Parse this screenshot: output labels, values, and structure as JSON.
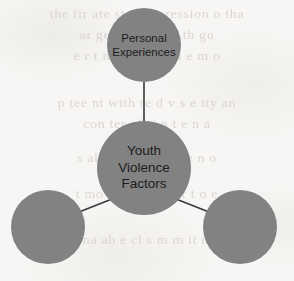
{
  "background": {
    "page_color": "#f7f6f4",
    "ghost_text_color": "#cfcbc6",
    "ghost_lines": [
      "the fir ate state s pression o  tha",
      "ar    ge      re ua     r ion  th  gu",
      "e r  t  n  e  re  ces   tin   e m   o",
      "p tee nt with  re d v s  e    ity   an",
      "con ter   of       ti n  t  e   n  a",
      "s al er  nt  ve     e  ss   re n  o",
      "t  mo  an  str    re   n  ar  t  o  e",
      "e  na ab e  cl s  m  m   it  n  ti"
    ]
  },
  "diagram": {
    "type": "hub-and-spoke",
    "node_color": "#828282",
    "connector_color": "#3a3a3a",
    "nodes": [
      {
        "id": "hub",
        "label": "Youth\nViolence\nFactors",
        "role": "center",
        "has_label": true,
        "diameter": 94,
        "center_x": 144,
        "center_y": 168
      },
      {
        "id": "personal-experiences",
        "label": "Personal\nExperiences",
        "role": "spoke",
        "has_label": true,
        "diameter": 74,
        "center_x": 144,
        "center_y": 45
      },
      {
        "id": "factor-2",
        "label": "",
        "role": "spoke",
        "has_label": false,
        "diameter": 74,
        "center_x": 48,
        "center_y": 227
      },
      {
        "id": "factor-3",
        "label": "",
        "role": "spoke",
        "has_label": false,
        "diameter": 74,
        "center_x": 240,
        "center_y": 227
      }
    ],
    "connectors": [
      {
        "from": "hub",
        "to": "personal-experiences"
      },
      {
        "from": "hub",
        "to": "factor-2"
      },
      {
        "from": "hub",
        "to": "factor-3"
      }
    ]
  }
}
